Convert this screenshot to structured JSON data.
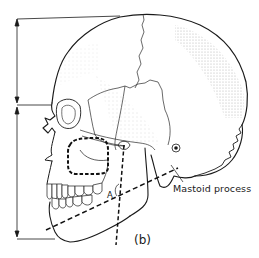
{
  "figure": {
    "panel_label": "(b)",
    "view": "lateral view of human skull",
    "labels": {
      "mastoid": "Mastoid process",
      "angle": "A"
    },
    "measurements": [
      {
        "name": "cranial-height",
        "description": "vertical extent from vertex to orbit level",
        "orientation": "vertical"
      },
      {
        "name": "facial-height",
        "description": "vertical extent from orbit level to menton",
        "orientation": "vertical"
      }
    ],
    "annotations": [
      {
        "name": "maxillary-sinus-outline",
        "style": "dashed"
      },
      {
        "name": "ramus-line",
        "style": "dashed"
      },
      {
        "name": "mandibular-plane-line",
        "style": "dashed"
      }
    ],
    "colors": {
      "ink": "#1a1a1a",
      "stipple": "#9a9a9a",
      "background": "#ffffff"
    }
  }
}
